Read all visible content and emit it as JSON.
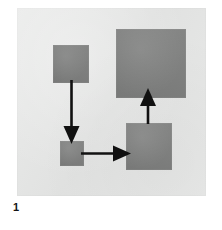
{
  "figure": {
    "label": "1",
    "caption_number": "1",
    "panel": {
      "background_color": "#e6e7e6",
      "page_background_color": "#ffffff"
    },
    "node_fill_color": "#7e7f7e",
    "edge_color": "#111111",
    "nodes": [
      {
        "id": "node-a",
        "name": "top-left-block",
        "label": "",
        "x": 53,
        "y": 45,
        "width": 36,
        "height": 38
      },
      {
        "id": "node-b",
        "name": "top-right-block",
        "label": "",
        "x": 116,
        "y": 29,
        "width": 70,
        "height": 69
      },
      {
        "id": "node-c",
        "name": "bottom-left-block",
        "label": "",
        "x": 60,
        "y": 141,
        "width": 24,
        "height": 25
      },
      {
        "id": "node-d",
        "name": "bottom-right-block",
        "label": "",
        "x": 126,
        "y": 123,
        "width": 46,
        "height": 47
      }
    ],
    "edges": [
      {
        "id": "edge-a-to-c",
        "name": "arrow-down-left",
        "label": "",
        "from": "node-a",
        "to": "node-c",
        "direction": "down"
      },
      {
        "id": "edge-c-to-d",
        "name": "arrow-right",
        "label": "",
        "from": "node-c",
        "to": "node-d",
        "direction": "right"
      },
      {
        "id": "edge-d-to-b",
        "name": "arrow-up-right",
        "label": "",
        "from": "node-d",
        "to": "node-b",
        "direction": "up"
      }
    ]
  }
}
